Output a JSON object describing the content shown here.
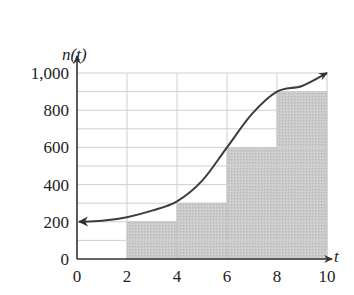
{
  "chart_data": {
    "type": "line",
    "title": "",
    "xlabel": "t",
    "ylabel": "n(t)",
    "xlim": [
      0,
      10
    ],
    "ylim": [
      0,
      1000
    ],
    "x_ticks": [
      0,
      2,
      4,
      6,
      8,
      10
    ],
    "x_tick_labels": [
      "0",
      "2",
      "4",
      "6",
      "8",
      "10"
    ],
    "y_ticks": [
      0,
      200,
      400,
      600,
      800,
      1000
    ],
    "y_tick_labels": [
      "0",
      "200",
      "400",
      "600",
      "800",
      "1,000"
    ],
    "grid": {
      "x_step": 2,
      "y_step": 100,
      "on": true
    },
    "series": [
      {
        "name": "n(t) curve",
        "kind": "line",
        "x": [
          0,
          1,
          2,
          3,
          4,
          5,
          6,
          7,
          8,
          9,
          10
        ],
        "values": [
          200,
          205,
          225,
          260,
          310,
          420,
          600,
          780,
          900,
          930,
          1000
        ],
        "arrows": [
          "left-end",
          "right-end"
        ]
      },
      {
        "name": "Rectangles",
        "kind": "bar",
        "intervals": [
          [
            2,
            4
          ],
          [
            4,
            6
          ],
          [
            6,
            8
          ],
          [
            8,
            10
          ]
        ],
        "values": [
          200,
          300,
          600,
          900
        ]
      }
    ],
    "colors": {
      "bar_fill": "#c9c9c9",
      "grid": "#d0d0d0",
      "curve": "#3c3c3c",
      "axis": "#333333"
    }
  }
}
